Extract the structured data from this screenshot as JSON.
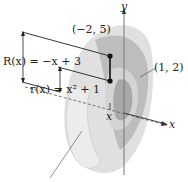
{
  "figure": {
    "type": "solid-of-revolution-washer",
    "labels": {
      "R_eq": "R(x) = −x + 3",
      "r_eq": "r(x) = x² + 1",
      "point_top": "(−2, 5)",
      "point_right": "(1, 2)",
      "y_axis": "y",
      "x_axis": "x",
      "x_marker": "x"
    },
    "colors": {
      "solid_light": "#d9d9d9",
      "solid_mid": "#bdbdbd",
      "solid_dark": "#9e9e9e",
      "line": "#222222",
      "axis": "#777777"
    }
  }
}
